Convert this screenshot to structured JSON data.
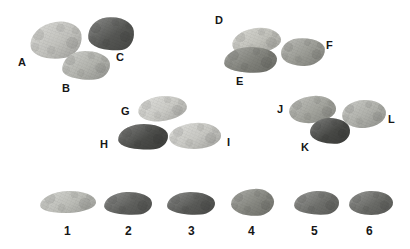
{
  "figure": {
    "kind": "lithic-specimen-plate",
    "background_color": "#ffffff",
    "width": 410,
    "height": 249,
    "label_color": "#161616",
    "groups": [
      {
        "name": "group-abc",
        "labels": [
          "A",
          "B",
          "C"
        ]
      },
      {
        "name": "group-def",
        "labels": [
          "D",
          "E",
          "F"
        ]
      },
      {
        "name": "group-ghi",
        "labels": [
          "G",
          "H",
          "I"
        ]
      },
      {
        "name": "group-jkl",
        "labels": [
          "J",
          "K",
          "L"
        ]
      },
      {
        "name": "row-numbered",
        "labels": [
          "1",
          "2",
          "3",
          "4",
          "5",
          "6"
        ]
      }
    ]
  },
  "specimens": [
    {
      "id": "A",
      "label": "A",
      "group": "group-abc",
      "color": "#c9c9c4",
      "tone": "light",
      "x": 30,
      "y": 22,
      "w": 52,
      "h": 37,
      "rotate": -8,
      "radius": "54% 46% 40% 60% / 58% 44% 56% 42%"
    },
    {
      "id": "B",
      "label": "B",
      "group": "group-abc",
      "color": "#b9bab4",
      "tone": "light-medium",
      "x": 62,
      "y": 51,
      "w": 48,
      "h": 29,
      "rotate": -4,
      "radius": "44% 56% 34% 66% / 60% 50% 50% 40%"
    },
    {
      "id": "C",
      "label": "C",
      "group": "group-abc",
      "color": "#595a57",
      "tone": "dark",
      "x": 88,
      "y": 17,
      "w": 46,
      "h": 34,
      "rotate": -6,
      "radius": "44% 56% 30% 70% / 56% 48% 52% 44%"
    },
    {
      "id": "D",
      "label": "D",
      "group": "group-def",
      "color": "#c8c8c1",
      "tone": "light",
      "x": 232,
      "y": 28,
      "w": 49,
      "h": 26,
      "rotate": -7,
      "radius": "52% 48% 62% 38% / 56% 56% 44% 44%"
    },
    {
      "id": "E",
      "label": "E",
      "group": "group-def",
      "color": "#85867f",
      "tone": "medium-dark",
      "x": 224,
      "y": 47,
      "w": 53,
      "h": 26,
      "rotate": -3,
      "radius": "46% 54% 34% 66% / 58% 50% 50% 42%"
    },
    {
      "id": "F",
      "label": "F",
      "group": "group-def",
      "color": "#a0a19a",
      "tone": "medium",
      "x": 281,
      "y": 38,
      "w": 44,
      "h": 28,
      "rotate": -5,
      "radius": "40% 60% 44% 56% / 52% 46% 54% 48%"
    },
    {
      "id": "G",
      "label": "G",
      "group": "group-ghi",
      "color": "#d2d2cd",
      "tone": "very-light",
      "x": 138,
      "y": 96,
      "w": 49,
      "h": 25,
      "rotate": -6,
      "radius": "48% 52% 56% 44% / 54% 52% 48% 46%"
    },
    {
      "id": "H",
      "label": "H",
      "group": "group-ghi",
      "color": "#4d4e4b",
      "tone": "very-dark",
      "x": 118,
      "y": 124,
      "w": 50,
      "h": 26,
      "rotate": -4,
      "radius": "46% 54% 30% 70% / 56% 50% 50% 44%"
    },
    {
      "id": "I",
      "label": "I",
      "group": "group-ghi",
      "color": "#cfcfca",
      "tone": "very-light",
      "x": 169,
      "y": 123,
      "w": 52,
      "h": 26,
      "rotate": -4,
      "radius": "52% 48% 46% 54% / 50% 54% 46% 50%"
    },
    {
      "id": "J",
      "label": "J",
      "group": "group-jkl",
      "color": "#a8a9a2",
      "tone": "medium",
      "x": 289,
      "y": 96,
      "w": 47,
      "h": 27,
      "rotate": -5,
      "radius": "54% 46% 54% 46% / 52% 54% 46% 48%"
    },
    {
      "id": "K",
      "label": "K",
      "group": "group-jkl",
      "color": "#4a4b48",
      "tone": "very-dark",
      "x": 310,
      "y": 118,
      "w": 40,
      "h": 26,
      "rotate": -3,
      "radius": "48% 52% 34% 66% / 52% 50% 50% 48%"
    },
    {
      "id": "L",
      "label": "L",
      "group": "group-jkl",
      "color": "#b5b6b0",
      "tone": "light-medium",
      "x": 342,
      "y": 100,
      "w": 44,
      "h": 28,
      "rotate": -4,
      "radius": "50% 50% 50% 50% / 52% 50% 50% 48%"
    },
    {
      "id": "1",
      "label": "1",
      "group": "row-numbered",
      "color": "#c3c4be",
      "tone": "light",
      "x": 40,
      "y": 191,
      "w": 56,
      "h": 22,
      "rotate": -3,
      "radius": "50% 50% 48% 52% / 60% 58% 42% 40%"
    },
    {
      "id": "2",
      "label": "2",
      "group": "row-numbered",
      "color": "#636461",
      "tone": "dark",
      "x": 104,
      "y": 192,
      "w": 48,
      "h": 23,
      "rotate": -3,
      "radius": "48% 52% 30% 70% / 58% 52% 48% 42%"
    },
    {
      "id": "3",
      "label": "3",
      "group": "row-numbered",
      "color": "#5d5e5b",
      "tone": "dark",
      "x": 167,
      "y": 192,
      "w": 48,
      "h": 23,
      "rotate": -3,
      "radius": "44% 56% 32% 68% / 56% 52% 48% 44%"
    },
    {
      "id": "4",
      "label": "4",
      "group": "row-numbered",
      "color": "#8a8b84",
      "tone": "medium",
      "x": 231,
      "y": 189,
      "w": 43,
      "h": 27,
      "rotate": -3,
      "radius": "56% 44% 40% 60% / 52% 50% 50% 48%"
    },
    {
      "id": "5",
      "label": "5",
      "group": "row-numbered",
      "color": "#737470",
      "tone": "medium-dark",
      "x": 294,
      "y": 191,
      "w": 45,
      "h": 24,
      "rotate": -3,
      "radius": "52% 48% 32% 68% / 56% 52% 48% 44%"
    },
    {
      "id": "6",
      "label": "6",
      "group": "row-numbered",
      "color": "#6e6f6b",
      "tone": "medium-dark",
      "x": 349,
      "y": 191,
      "w": 44,
      "h": 24,
      "rotate": -3,
      "radius": "48% 52% 44% 56% / 54% 52% 48% 46%"
    }
  ],
  "labels": [
    {
      "id": "label-A",
      "text": "A",
      "x": 18,
      "y": 57,
      "kind": "letter"
    },
    {
      "id": "label-B",
      "text": "B",
      "x": 62,
      "y": 83,
      "kind": "letter"
    },
    {
      "id": "label-C",
      "text": "C",
      "x": 116,
      "y": 52,
      "kind": "letter"
    },
    {
      "id": "label-D",
      "text": "D",
      "x": 215,
      "y": 15,
      "kind": "letter"
    },
    {
      "id": "label-E",
      "text": "E",
      "x": 236,
      "y": 76,
      "kind": "letter"
    },
    {
      "id": "label-F",
      "text": "F",
      "x": 326,
      "y": 40,
      "kind": "letter"
    },
    {
      "id": "label-G",
      "text": "G",
      "x": 121,
      "y": 106,
      "kind": "letter"
    },
    {
      "id": "label-H",
      "text": "H",
      "x": 100,
      "y": 139,
      "kind": "letter"
    },
    {
      "id": "label-I",
      "text": "I",
      "x": 227,
      "y": 137,
      "kind": "letter"
    },
    {
      "id": "label-J",
      "text": "J",
      "x": 277,
      "y": 104,
      "kind": "letter"
    },
    {
      "id": "label-K",
      "text": "K",
      "x": 301,
      "y": 142,
      "kind": "letter"
    },
    {
      "id": "label-L",
      "text": "L",
      "x": 388,
      "y": 114,
      "kind": "letter"
    },
    {
      "id": "label-1",
      "text": "1",
      "x": 64,
      "y": 225,
      "kind": "number"
    },
    {
      "id": "label-2",
      "text": "2",
      "x": 125,
      "y": 225,
      "kind": "number"
    },
    {
      "id": "label-3",
      "text": "3",
      "x": 188,
      "y": 225,
      "kind": "number"
    },
    {
      "id": "label-4",
      "text": "4",
      "x": 248,
      "y": 225,
      "kind": "number"
    },
    {
      "id": "label-5",
      "text": "5",
      "x": 311,
      "y": 225,
      "kind": "number"
    },
    {
      "id": "label-6",
      "text": "6",
      "x": 366,
      "y": 225,
      "kind": "number"
    }
  ]
}
